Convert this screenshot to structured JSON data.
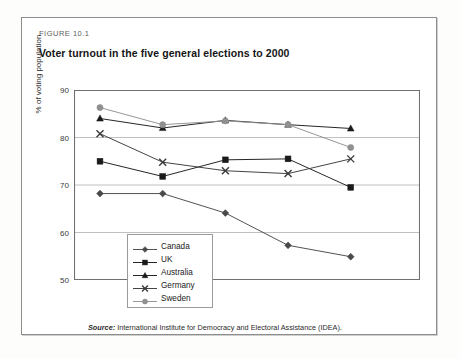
{
  "figure": {
    "label": "FIGURE 10.1",
    "title": "Voter turnout in the five general elections to 2000",
    "source_prefix": "Source:",
    "source_text": " International Institute for Democracy and Electoral Assistance (IDEA)."
  },
  "colors": {
    "frame": "#8d8d8d",
    "gridline": "#b9b9b9",
    "axis": "#707070",
    "series_dark": "#1a1a1a",
    "series_gray": "#808080",
    "page_background": "#fdfdfc",
    "plot_background": "#ffffff"
  },
  "chart_data": {
    "type": "line",
    "title": "Voter turnout in the five general elections to 2000",
    "xlabel": "",
    "ylabel": "% of voting population",
    "ylim": [
      50,
      90
    ],
    "yticks": [
      50,
      60,
      70,
      80,
      90
    ],
    "ytick_labels": [
      "50",
      "60",
      "70",
      "80",
      "90"
    ],
    "grid": true,
    "grid_axis": "y",
    "xtick_labels": [
      "",
      "",
      "",
      "",
      ""
    ],
    "x": [
      1,
      2,
      3,
      4,
      5
    ],
    "legend_position": "inside-lower-left",
    "series": [
      {
        "name": "Canada",
        "marker": "diamond",
        "color": "#4a4a4a",
        "values": [
          68.2,
          68.2,
          64.1,
          57.3,
          54.9
        ]
      },
      {
        "name": "UK",
        "marker": "square",
        "color": "#1a1a1a",
        "values": [
          75.0,
          71.8,
          75.3,
          75.5,
          69.5
        ]
      },
      {
        "name": "Australia",
        "marker": "triangle",
        "color": "#1a1a1a",
        "values": [
          84.0,
          82.0,
          83.6,
          82.7,
          81.9
        ]
      },
      {
        "name": "Germany",
        "marker": "cross",
        "color": "#3a3a3a",
        "values": [
          80.8,
          74.8,
          73.0,
          72.4,
          75.5
        ]
      },
      {
        "name": "Sweden",
        "marker": "circle",
        "color": "#909090",
        "values": [
          86.3,
          82.7,
          83.5,
          82.7,
          77.9
        ]
      }
    ]
  }
}
